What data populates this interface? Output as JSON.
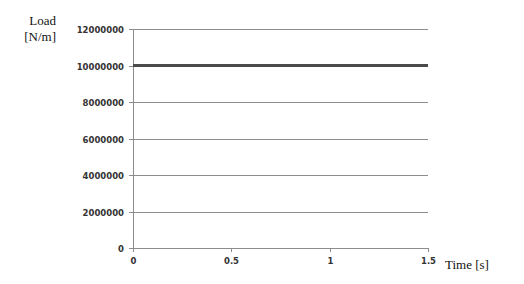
{
  "chart_data": {
    "type": "line",
    "title": "",
    "xlabel": "Time [s]",
    "ylabel": "Load [N/m]",
    "xlim": [
      0,
      1.5
    ],
    "ylim": [
      0,
      12000000
    ],
    "x_ticks": [
      "0",
      "0.5",
      "1",
      "1.5"
    ],
    "y_ticks": [
      "0",
      "2000000",
      "4000000",
      "6000000",
      "8000000",
      "10000000",
      "12000000"
    ],
    "grid": true,
    "legend": null,
    "series": [
      {
        "name": "Load",
        "x": [
          0,
          1.5
        ],
        "values": [
          10000000,
          10000000
        ],
        "color": "#4a4a4a"
      }
    ]
  },
  "labels": {
    "y_line1": "Load",
    "y_line2": "[N/m]",
    "x": "Time [s]"
  }
}
